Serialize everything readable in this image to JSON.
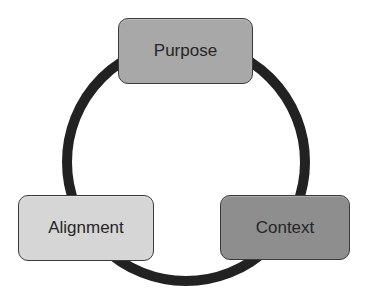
{
  "diagram": {
    "type": "cycle",
    "ring": {
      "center_x": 186,
      "center_y": 162,
      "radius": 119,
      "stroke_width": 10,
      "color": "#222222"
    },
    "nodes": [
      {
        "id": "purpose",
        "label": "Purpose",
        "fill": "#a8a8a8",
        "position": "top"
      },
      {
        "id": "context",
        "label": "Context",
        "fill": "#8e8e8e",
        "position": "bottom-right"
      },
      {
        "id": "alignment",
        "label": "Alignment",
        "fill": "#d6d6d6",
        "position": "bottom-left"
      }
    ]
  }
}
